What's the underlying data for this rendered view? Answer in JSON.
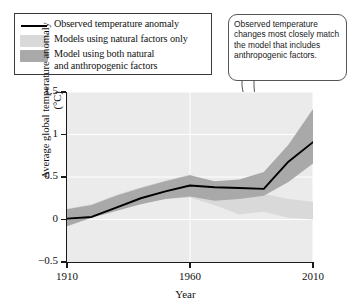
{
  "legend": {
    "items": [
      {
        "key": "line",
        "label": "Observed temperature anomaly",
        "color": "#000000"
      },
      {
        "key": "swatch",
        "label": "Models using natural factors only",
        "color": "#d9d9d9"
      },
      {
        "key": "swatch",
        "label": "Model using both natural\nand anthropogenic factors",
        "color": "#a9a9a9"
      }
    ]
  },
  "callout": {
    "text": "Observed temperature changes most closely match the model that includes anthropogenic factors."
  },
  "chart_data": {
    "type": "line",
    "title": "",
    "xlabel": "Year",
    "ylabel": "Average global temperature anomaly (°C)",
    "xlim": [
      1910,
      2010
    ],
    "ylim": [
      -0.5,
      1.5
    ],
    "xticks": [
      1910,
      1960,
      2010
    ],
    "xticklabels": [
      "1910",
      "1960",
      "2010"
    ],
    "yticks": [
      -0.5,
      0,
      0.5,
      1,
      1.5
    ],
    "yticklabels": [
      "−0.5",
      "0",
      "0.5",
      "1",
      "1.5"
    ],
    "grid": true,
    "legend_position": "above-left",
    "plot_background": "#ebebeb",
    "x": [
      1910,
      1920,
      1930,
      1940,
      1950,
      1960,
      1970,
      1980,
      1990,
      2000,
      2010
    ],
    "series": [
      {
        "name": "Observed temperature anomaly",
        "type": "line",
        "color": "#000000",
        "values": [
          0.01,
          0.03,
          0.14,
          0.25,
          0.33,
          0.4,
          0.38,
          0.37,
          0.36,
          0.68,
          0.91
        ]
      },
      {
        "name": "Model using both natural and anthropogenic factors",
        "type": "band",
        "color": "#a9a9a9",
        "lower": [
          -0.08,
          0.02,
          0.1,
          0.18,
          0.24,
          0.27,
          0.22,
          0.24,
          0.28,
          0.44,
          0.66
        ],
        "upper": [
          0.12,
          0.17,
          0.28,
          0.37,
          0.45,
          0.52,
          0.45,
          0.47,
          0.56,
          0.88,
          1.3
        ]
      },
      {
        "name": "Models using natural factors only",
        "type": "band",
        "color": "#d9d9d9",
        "lower": [
          -0.06,
          0.03,
          0.11,
          0.19,
          0.24,
          0.26,
          0.17,
          0.06,
          0.09,
          0.02,
          0.0
        ],
        "upper": [
          0.13,
          0.18,
          0.29,
          0.38,
          0.46,
          0.53,
          0.4,
          0.44,
          0.3,
          0.24,
          0.21
        ]
      }
    ]
  }
}
